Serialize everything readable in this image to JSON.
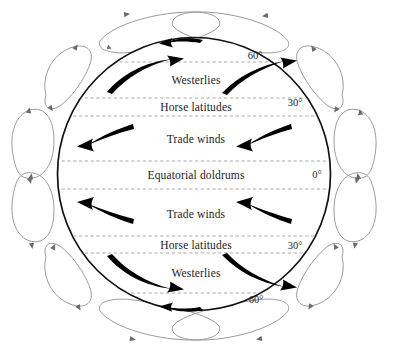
{
  "figure": {
    "type": "diagram",
    "colors": {
      "globe_outline": "#111111",
      "inner_arrow": "#000000",
      "cell_outline": "#8a8a8a",
      "zone_divider": "#9a9a9a",
      "background": "#ffffff",
      "text": "#1c1c1c"
    },
    "globe": {
      "center_x": 194,
      "center_y": 174,
      "radius": 137
    }
  },
  "zones": [
    {
      "id": "polar-easterlies-north",
      "label": "",
      "y": 48
    },
    {
      "id": "westerlies-north",
      "label": "Westerlies",
      "x": 196,
      "y": 80
    },
    {
      "id": "horse-latitudes-north",
      "label": "Horse latitudes",
      "x": 196,
      "y": 107
    },
    {
      "id": "trade-winds-north",
      "label": "Trade winds",
      "x": 196,
      "y": 139
    },
    {
      "id": "equatorial-doldrums",
      "label": "Equatorial doldrums",
      "x": 196,
      "y": 175
    },
    {
      "id": "trade-winds-south",
      "label": "Trade winds",
      "x": 196,
      "y": 214
    },
    {
      "id": "horse-latitudes-south",
      "label": "Horse latitudes",
      "x": 196,
      "y": 245
    },
    {
      "id": "westerlies-south",
      "label": "Westerlies",
      "x": 196,
      "y": 273
    }
  ],
  "latitude_labels": [
    {
      "id": "lat-60n",
      "label": "60°",
      "x": 255,
      "y": 55
    },
    {
      "id": "lat-30n",
      "label": "30°",
      "x": 295,
      "y": 102
    },
    {
      "id": "lat-0",
      "label": "0°",
      "x": 317,
      "y": 174
    },
    {
      "id": "lat-30s",
      "label": "30°",
      "x": 295,
      "y": 245
    },
    {
      "id": "lat-60s",
      "label": "60°",
      "x": 256,
      "y": 299
    }
  ],
  "zone_dividers": [
    {
      "id": "divider-60n",
      "y": 62
    },
    {
      "id": "divider-30n-upper",
      "y": 98
    },
    {
      "id": "divider-30n-lower",
      "y": 116
    },
    {
      "id": "divider-eq-upper",
      "y": 161
    },
    {
      "id": "divider-eq-lower",
      "y": 189
    },
    {
      "id": "divider-30s-upper",
      "y": 236
    },
    {
      "id": "divider-30s-lower",
      "y": 253
    },
    {
      "id": "divider-60s",
      "y": 293
    }
  ],
  "surface_arrows": [
    {
      "id": "polar-easterlies-arrow-north",
      "direction": "westward"
    },
    {
      "id": "westerlies-arrow-north-left",
      "direction": "eastward"
    },
    {
      "id": "westerlies-arrow-north-right",
      "direction": "eastward"
    },
    {
      "id": "trade-winds-arrow-north-left",
      "direction": "westward"
    },
    {
      "id": "trade-winds-arrow-north-right",
      "direction": "westward"
    },
    {
      "id": "trade-winds-arrow-south-left",
      "direction": "westward"
    },
    {
      "id": "trade-winds-arrow-south-right",
      "direction": "westward"
    },
    {
      "id": "westerlies-arrow-south-left",
      "direction": "eastward"
    },
    {
      "id": "westerlies-arrow-south-right",
      "direction": "eastward"
    },
    {
      "id": "polar-easterlies-arrow-south",
      "direction": "westward"
    }
  ],
  "circulation_cells": [
    {
      "id": "polar-cell-north-left",
      "hemisphere": "north",
      "side": "left"
    },
    {
      "id": "ferrel-cell-north-left",
      "hemisphere": "north",
      "side": "left"
    },
    {
      "id": "hadley-cell-north-left",
      "hemisphere": "north",
      "side": "left"
    },
    {
      "id": "polar-cell-north-right",
      "hemisphere": "north",
      "side": "right"
    },
    {
      "id": "ferrel-cell-north-right",
      "hemisphere": "north",
      "side": "right"
    },
    {
      "id": "hadley-cell-north-right",
      "hemisphere": "north",
      "side": "right"
    },
    {
      "id": "hadley-cell-south-left",
      "hemisphere": "south",
      "side": "left"
    },
    {
      "id": "ferrel-cell-south-left",
      "hemisphere": "south",
      "side": "left"
    },
    {
      "id": "polar-cell-south-left",
      "hemisphere": "south",
      "side": "left"
    },
    {
      "id": "hadley-cell-south-right",
      "hemisphere": "south",
      "side": "right"
    },
    {
      "id": "ferrel-cell-south-right",
      "hemisphere": "south",
      "side": "right"
    },
    {
      "id": "polar-cell-south-right",
      "hemisphere": "south",
      "side": "right"
    }
  ]
}
